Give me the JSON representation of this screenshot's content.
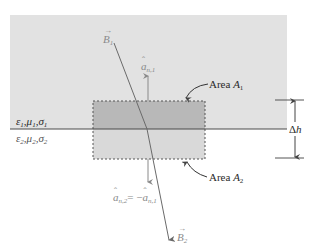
{
  "diagram": {
    "type": "boundary-condition-pillbox",
    "colors": {
      "medium1_fill": "#e2e2e2",
      "pillbox_upper_fill": "#b8b8b8",
      "pillbox_lower_fill": "#d8d8d8",
      "interface_line": "#4a4a4a",
      "dashed_border": "#555555",
      "vector_line": "#6a6a6a",
      "normal_arrow": "#8a8a8a"
    },
    "medium1": {
      "label_eps": "ε",
      "label_mu": "μ",
      "label_sigma": "σ",
      "subscript": "1"
    },
    "medium2": {
      "label_eps": "ε",
      "label_mu": "μ",
      "label_sigma": "σ",
      "subscript": "2"
    },
    "vectors": {
      "B1": {
        "symbol": "B",
        "subscript": "1"
      },
      "B2": {
        "symbol": "B",
        "subscript": "2"
      }
    },
    "normals": {
      "an1": {
        "symbol": "a",
        "subscript": "n,1"
      },
      "an2": {
        "symbol": "a",
        "subscript": "n,2",
        "equals": "= −",
        "rhs_symbol": "a",
        "rhs_subscript": "n,1"
      }
    },
    "areas": {
      "A1": {
        "prefix": "Area ",
        "symbol": "A",
        "subscript": "1"
      },
      "A2": {
        "prefix": "Area ",
        "symbol": "A",
        "subscript": "2"
      }
    },
    "height": {
      "delta": "Δ",
      "symbol": "h"
    }
  }
}
